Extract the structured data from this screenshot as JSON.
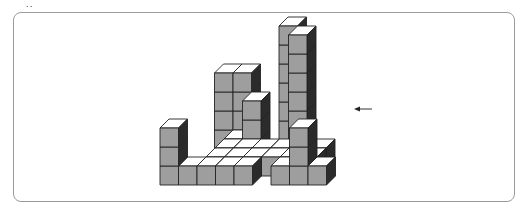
{
  "figure": {
    "label": "˙˙",
    "arrow": {
      "x1": 372,
      "y1": 109,
      "x2": 354,
      "y2": 109,
      "direction": "left"
    },
    "colors": {
      "top": "#ffffff",
      "front": "#9e9e9e",
      "side": "#2b2b2b",
      "edge": "#222222",
      "border": "#9a9a9a"
    },
    "unit": {
      "w": 18.5,
      "h": 19,
      "dx": 9,
      "dy": 9
    },
    "origin": {
      "x": 160,
      "y": 185
    },
    "cubes": [
      [
        5,
        4,
        0
      ],
      [
        5,
        4,
        1
      ],
      [
        5,
        4,
        2
      ],
      [
        5,
        4,
        3
      ],
      [
        5,
        4,
        4
      ],
      [
        5,
        4,
        5
      ],
      [
        4,
        5,
        0
      ],
      [
        4,
        5,
        1
      ],
      [
        4,
        5,
        2
      ],
      [
        4,
        5,
        3
      ],
      [
        4,
        5,
        4
      ],
      [
        4,
        5,
        5
      ],
      [
        3,
        3,
        0
      ],
      [
        3,
        3,
        1
      ],
      [
        3,
        3,
        2
      ],
      [
        1,
        4,
        0
      ],
      [
        1,
        4,
        1
      ],
      [
        1,
        4,
        2
      ],
      [
        1,
        4,
        3
      ],
      [
        2,
        4,
        0
      ],
      [
        2,
        4,
        1
      ],
      [
        2,
        4,
        2
      ],
      [
        2,
        4,
        3
      ],
      [
        2,
        3,
        0
      ],
      [
        3,
        2,
        0
      ],
      [
        4,
        2,
        0
      ],
      [
        5,
        2,
        0
      ],
      [
        6,
        2,
        0
      ],
      [
        2,
        2,
        0
      ],
      [
        3,
        1,
        0
      ],
      [
        4,
        1,
        0
      ],
      [
        5,
        1,
        0
      ],
      [
        6,
        1,
        0
      ],
      [
        2,
        1,
        0
      ],
      [
        1,
        0,
        0
      ],
      [
        2,
        0,
        0
      ],
      [
        3,
        0,
        0
      ],
      [
        4,
        0,
        0
      ],
      [
        7,
        2,
        0
      ],
      [
        7,
        1,
        0
      ],
      [
        6,
        0,
        0
      ],
      [
        7,
        0,
        0
      ],
      [
        8,
        0,
        0
      ],
      [
        7,
        0,
        1
      ],
      [
        7,
        0,
        2
      ],
      [
        0,
        0,
        0
      ],
      [
        0,
        0,
        1
      ],
      [
        0,
        0,
        2
      ]
    ]
  }
}
